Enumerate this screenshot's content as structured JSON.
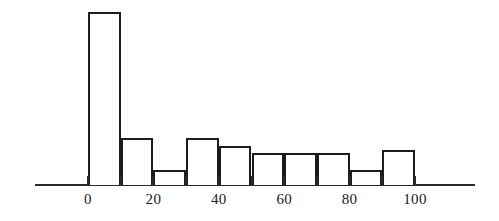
{
  "chart_data": {
    "type": "bar",
    "title": "",
    "subtitle": "",
    "xlabel": "",
    "ylabel": "",
    "grid": false,
    "legend": "none",
    "orientation": "vertical",
    "bar_gap": 0,
    "axis": {
      "x_ticks": [
        0,
        20,
        40,
        60,
        80,
        100
      ],
      "x_tick_labels": [
        "0",
        "20",
        "40",
        "60",
        "80",
        "100"
      ],
      "x_minor_ticks": [
        10,
        30,
        50,
        70,
        90
      ],
      "xlim": [
        -16,
        118
      ],
      "ylim": [
        0,
        1
      ],
      "y_axis_visible": false,
      "y_tick_labels": []
    },
    "bin_width": 10,
    "bin_edges": [
      0,
      10,
      20,
      30,
      40,
      50,
      60,
      70,
      80,
      90,
      100
    ],
    "categories": [
      "0-10",
      "10-20",
      "20-30",
      "30-40",
      "40-50",
      "50-60",
      "60-70",
      "70-80",
      "80-90",
      "90-100"
    ],
    "values": [
      1.0,
      0.27,
      0.087,
      0.27,
      0.225,
      0.185,
      0.185,
      0.185,
      0.087,
      0.2
    ],
    "bar_pixel_heights": [
      173,
      46,
      15,
      46,
      39,
      32,
      32,
      32,
      15,
      35
    ],
    "colors": {
      "bar_fill": "#ffffff",
      "bar_stroke": "#1c1c1c",
      "axis": "#2a2a2a",
      "text": "#1a1a1a",
      "background": "#ffffff"
    }
  },
  "figure": {
    "caption": "",
    "annotations": []
  }
}
